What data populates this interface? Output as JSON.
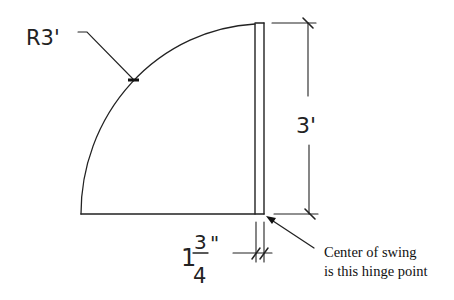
{
  "diagram": {
    "radius_label": "R3'",
    "height_label": "3'",
    "thickness_label": {
      "whole": "1",
      "numerator": "3",
      "denominator": "4",
      "unit": "\""
    },
    "note": {
      "line1": "Center of swing",
      "line2": "is this hinge point"
    },
    "colors": {
      "line": "#222222",
      "background": "#ffffff"
    }
  }
}
